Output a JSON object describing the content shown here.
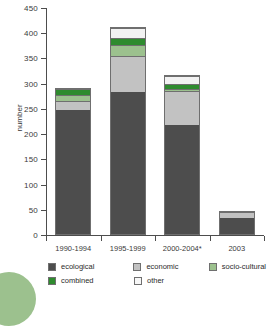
{
  "chart_data": {
    "type": "bar",
    "stacked": true,
    "title": "",
    "xlabel": "",
    "ylabel": "number",
    "ylim": [
      0,
      450
    ],
    "ytick_step": 50,
    "yticks": [
      0,
      50,
      100,
      150,
      200,
      250,
      300,
      350,
      400,
      450
    ],
    "grid": false,
    "legend_position": "bottom",
    "categories": [
      "1990-1994",
      "1995-1999",
      "2000-2004*",
      "2003"
    ],
    "series": [
      {
        "name": "ecological",
        "color": "#4d4d4d",
        "values": [
          250,
          285,
          219,
          35
        ]
      },
      {
        "name": "economic",
        "color": "#c2c2c2",
        "values": [
          17,
          71,
          68,
          12
        ]
      },
      {
        "name": "socio-cultural",
        "color": "#9cc18e",
        "values": [
          13,
          22,
          4,
          0
        ]
      },
      {
        "name": "combined",
        "color": "#2e8b2e",
        "values": [
          12,
          15,
          11,
          0
        ]
      },
      {
        "name": "other",
        "color": "#f2f2f2",
        "values": [
          0,
          20,
          16,
          0
        ]
      }
    ],
    "totals": [
      292,
      413,
      318,
      47
    ]
  },
  "axis": {
    "y_label": "number",
    "y_tick_labels": [
      "0",
      "50",
      "100",
      "150",
      "200",
      "250",
      "300",
      "350",
      "400",
      "450"
    ],
    "x_tick_labels": [
      "1990-1994",
      "1995-1999",
      "2000-2004*",
      "2003"
    ]
  },
  "legend": {
    "row1": [
      {
        "label": "ecological",
        "color": "#4d4d4d"
      },
      {
        "label": "economic",
        "color": "#c2c2c2"
      },
      {
        "label": "socio-cultural",
        "color": "#9cc18e"
      }
    ],
    "row2": [
      {
        "label": "combined",
        "color": "#2e8b2e"
      },
      {
        "label": "other",
        "color": "#f7f7f7"
      }
    ]
  }
}
